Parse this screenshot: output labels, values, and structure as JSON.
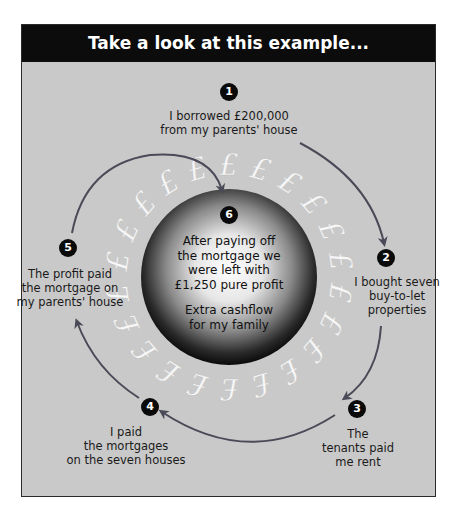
{
  "header": {
    "title": "Take a look at this example..."
  },
  "colors": {
    "header_bg": "#0c0c0c",
    "panel_bg": "#c9c9c9",
    "arrow": "#4a4a58",
    "badge": "#0a0a0a",
    "pound_glyph": "#f5f5f5"
  },
  "steps": [
    {
      "number": "1",
      "lines": [
        "I borrowed £200,000",
        "from my parents' house"
      ]
    },
    {
      "number": "2",
      "lines": [
        "I bought seven",
        "buy-to-let",
        "properties"
      ]
    },
    {
      "number": "3",
      "lines": [
        "The",
        "tenants paid",
        "me rent"
      ]
    },
    {
      "number": "4",
      "lines": [
        "I paid",
        "the mortgages",
        "on the seven houses"
      ]
    },
    {
      "number": "5",
      "lines": [
        "The profit paid",
        "the mortgage on",
        "my parents' house"
      ]
    }
  ],
  "center": {
    "number": "6",
    "lines": [
      "After paying off",
      "the mortgage we",
      "were left with",
      "£1,250 pure profit"
    ],
    "extra_lines": [
      "Extra cashflow",
      "for my family"
    ]
  },
  "ring": {
    "glyph": "£",
    "icon": "pound-sign-icon"
  }
}
